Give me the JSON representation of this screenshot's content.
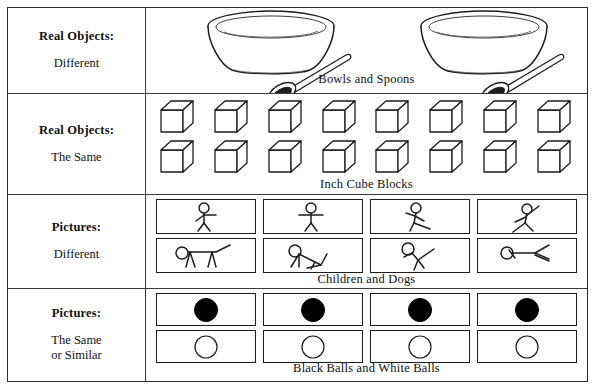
{
  "figure": {
    "rows": [
      {
        "id": "real-objects-different",
        "label_title": "Real Objects:",
        "label_sub": "Different",
        "label_sub2": "",
        "caption": "Bowls and Spoons",
        "item_kind": "bowl-and-spoon",
        "item_count": 2,
        "columns": 2,
        "lines": 1
      },
      {
        "id": "real-objects-the-same",
        "label_title": "Real Objects:",
        "label_sub": "The Same",
        "label_sub2": "",
        "caption": "Inch Cube Blocks",
        "item_kind": "cube",
        "item_count": 16,
        "columns": 8,
        "lines": 2
      },
      {
        "id": "pictures-different",
        "label_title": "Pictures:",
        "label_sub": "Different",
        "label_sub2": "",
        "caption": "Children and Dogs",
        "item_kind": "card-stick-figure",
        "item_count": 8,
        "columns": 4,
        "lines": 2,
        "line_kinds": [
          "child",
          "dog"
        ]
      },
      {
        "id": "pictures-the-same-or-similar",
        "label_title": "Pictures:",
        "label_sub": "The Same",
        "label_sub2": "or Similar",
        "caption": "Black Balls and White Balls",
        "item_kind": "card-ball",
        "item_count": 8,
        "columns": 4,
        "lines": 2,
        "line_kinds": [
          "black-ball",
          "white-ball"
        ]
      }
    ]
  },
  "colors": {
    "ink": "#111111",
    "border": "#2b2b2b",
    "divider": "#3a3a3a",
    "black_ball": "#000000",
    "white_ball": "#ffffff",
    "page": "#ffffff"
  }
}
